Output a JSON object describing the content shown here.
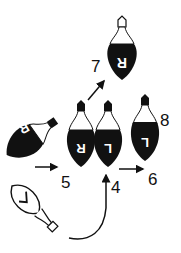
{
  "diagram": {
    "labels": {
      "seven": "7",
      "eight": "8",
      "five": "5",
      "four": "4",
      "six": "6"
    },
    "bulb_letters": {
      "top": "R",
      "left": "R",
      "mid_left": "R",
      "mid_right": "L",
      "right": "L",
      "bottom": "V"
    },
    "colors": {
      "ink": "#111111",
      "paper": "#ffffff"
    }
  }
}
